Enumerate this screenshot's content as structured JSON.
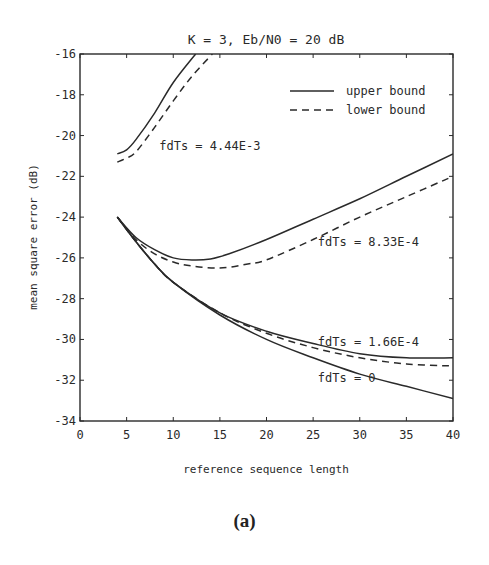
{
  "chart_data": {
    "type": "line",
    "title": "K = 3,  Eb/N0 = 20 dB",
    "xlabel": "reference sequence length",
    "ylabel": "mean square error (dB)",
    "xlim": [
      0,
      40
    ],
    "ylim": [
      -34,
      -16
    ],
    "xticks": [
      0,
      5,
      10,
      15,
      20,
      25,
      30,
      35,
      40
    ],
    "yticks": [
      -16,
      -18,
      -20,
      -22,
      -24,
      -26,
      -28,
      -30,
      -32,
      -34
    ],
    "grid": false,
    "legend": {
      "position": "upper right",
      "entries": [
        {
          "label": "upper bound",
          "style": "solid"
        },
        {
          "label": "lower bound",
          "style": "dashed"
        }
      ]
    },
    "series": [
      {
        "name": "fdTs = 4.44E-3 upper bound",
        "style": "solid",
        "x": [
          4,
          5,
          6,
          8,
          10,
          12.4
        ],
        "y": [
          -20.9,
          -20.7,
          -20.2,
          -18.9,
          -17.4,
          -16.0
        ]
      },
      {
        "name": "fdTs = 4.44E-3 lower bound",
        "style": "dashed",
        "x": [
          4,
          5,
          6,
          8,
          10,
          12,
          14.2
        ],
        "y": [
          -21.3,
          -21.1,
          -20.8,
          -19.6,
          -18.3,
          -17.1,
          -16.0
        ]
      },
      {
        "name": "fdTs = 8.33E-4 upper bound",
        "style": "solid",
        "x": [
          4,
          6,
          8,
          10,
          12,
          14,
          16,
          20,
          25,
          30,
          35,
          40
        ],
        "y": [
          -24.0,
          -25.0,
          -25.6,
          -26.0,
          -26.1,
          -26.05,
          -25.8,
          -25.1,
          -24.1,
          -23.1,
          -22.0,
          -20.9
        ]
      },
      {
        "name": "fdTs = 8.33E-4 lower bound",
        "style": "dashed",
        "x": [
          4,
          6,
          8,
          10,
          12,
          15,
          18,
          20,
          25,
          30,
          35,
          40
        ],
        "y": [
          -24.0,
          -25.1,
          -25.8,
          -26.2,
          -26.4,
          -26.5,
          -26.3,
          -26.1,
          -25.1,
          -24.0,
          -23.0,
          -22.0
        ]
      },
      {
        "name": "fdTs = 1.66E-4 upper bound",
        "style": "solid",
        "x": [
          4,
          6,
          8,
          10,
          15,
          20,
          25,
          30,
          35,
          40
        ],
        "y": [
          -24.0,
          -25.2,
          -26.3,
          -27.2,
          -28.7,
          -29.6,
          -30.2,
          -30.7,
          -30.9,
          -30.9
        ]
      },
      {
        "name": "fdTs = 1.66E-4 lower bound",
        "style": "dashed",
        "x": [
          4,
          6,
          8,
          10,
          15,
          20,
          25,
          30,
          35,
          40
        ],
        "y": [
          -24.0,
          -25.2,
          -26.3,
          -27.2,
          -28.7,
          -29.7,
          -30.4,
          -30.9,
          -31.2,
          -31.3
        ]
      },
      {
        "name": "fdTs = 0",
        "style": "solid",
        "x": [
          4,
          6,
          8,
          10,
          15,
          20,
          25,
          30,
          35,
          40
        ],
        "y": [
          -24.0,
          -25.2,
          -26.3,
          -27.2,
          -28.8,
          -30.0,
          -30.9,
          -31.7,
          -32.3,
          -32.9
        ]
      }
    ],
    "annotations": [
      {
        "text": "fdTs = 4.44E-3",
        "x": 8.5,
        "y": -20.7
      },
      {
        "text": "fdTs = 8.33E-4",
        "x": 25.5,
        "y": -25.4
      },
      {
        "text": "fdTs = 1.66E-4",
        "x": 25.5,
        "y": -30.3
      },
      {
        "text": "fdTs = 0",
        "x": 25.5,
        "y": -32.1
      }
    ]
  },
  "caption": "(a)"
}
